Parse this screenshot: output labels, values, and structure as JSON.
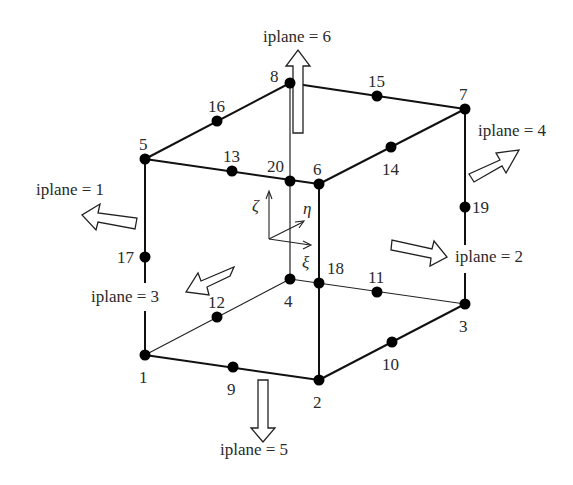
{
  "figure": {
    "nodes": [
      {
        "id": "1",
        "x": 145,
        "y": 355,
        "lx": 139,
        "ly": 383
      },
      {
        "id": "2",
        "x": 319,
        "y": 380,
        "lx": 313,
        "ly": 408
      },
      {
        "id": "3",
        "x": 465,
        "y": 304,
        "lx": 459,
        "ly": 332
      },
      {
        "id": "4",
        "x": 290,
        "y": 279,
        "lx": 284,
        "ly": 307
      },
      {
        "id": "5",
        "x": 145,
        "y": 159,
        "lx": 139,
        "ly": 150
      },
      {
        "id": "6",
        "x": 319,
        "y": 184,
        "lx": 313,
        "ly": 175
      },
      {
        "id": "7",
        "x": 465,
        "y": 109,
        "lx": 459,
        "ly": 100
      },
      {
        "id": "8",
        "x": 290,
        "y": 83,
        "lx": 270,
        "ly": 82
      },
      {
        "id": "9",
        "x": 233,
        "y": 367,
        "lx": 227,
        "ly": 395
      },
      {
        "id": "10",
        "x": 392,
        "y": 342,
        "lx": 382,
        "ly": 370
      },
      {
        "id": "11",
        "x": 377,
        "y": 292,
        "lx": 368,
        "ly": 283
      },
      {
        "id": "12",
        "x": 217,
        "y": 317,
        "lx": 208,
        "ly": 308
      },
      {
        "id": "13",
        "x": 232,
        "y": 171,
        "lx": 223,
        "ly": 162
      },
      {
        "id": "14",
        "x": 391,
        "y": 147,
        "lx": 382,
        "ly": 175
      },
      {
        "id": "15",
        "x": 377,
        "y": 96,
        "lx": 368,
        "ly": 87
      },
      {
        "id": "16",
        "x": 217,
        "y": 121,
        "lx": 208,
        "ly": 112
      },
      {
        "id": "17",
        "x": 145,
        "y": 257,
        "lx": 117,
        "ly": 263
      },
      {
        "id": "18",
        "x": 319,
        "y": 283,
        "lx": 327,
        "ly": 274
      },
      {
        "id": "19",
        "x": 465,
        "y": 207,
        "lx": 472,
        "ly": 213
      },
      {
        "id": "20",
        "x": 290,
        "y": 181,
        "lx": 267,
        "ly": 172
      }
    ],
    "planes": [
      {
        "label": "iplane = 1",
        "x": 36,
        "y": 195
      },
      {
        "label": "iplane = 2",
        "x": 455,
        "y": 262
      },
      {
        "label": "iplane = 3",
        "x": 91,
        "y": 302
      },
      {
        "label": "iplane = 4",
        "x": 478,
        "y": 136
      },
      {
        "label": "iplane = 5",
        "x": 220,
        "y": 455
      },
      {
        "label": "iplane = 6",
        "x": 263,
        "y": 42
      }
    ],
    "axes": {
      "zeta": "ζ",
      "eta": "η",
      "xi": "ξ"
    }
  }
}
